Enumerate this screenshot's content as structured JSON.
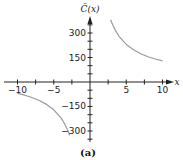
{
  "chart_data": {
    "type": "line",
    "title": "",
    "caption": "(a)",
    "xlabel": "x",
    "ylabel": "C̄(x)",
    "xlim": [
      -10,
      10
    ],
    "ylim": [
      -400,
      400
    ],
    "x_ticks": [
      -10,
      -7.5,
      -5,
      -2.5,
      2.5,
      5,
      7.5,
      10
    ],
    "x_tick_labels": [
      {
        "value": -10,
        "label": "−10"
      },
      {
        "value": -5,
        "label": "−5"
      },
      {
        "value": 5,
        "label": "5"
      },
      {
        "value": 10,
        "label": "10"
      }
    ],
    "y_ticks": [
      -350,
      -300,
      -250,
      -200,
      -150,
      -100,
      -50,
      50,
      100,
      150,
      200,
      250,
      300,
      350
    ],
    "y_tick_labels": [
      {
        "value": 300,
        "label": "300"
      },
      {
        "value": 150,
        "label": "150"
      },
      {
        "value": -150,
        "label": "−150"
      },
      {
        "value": -300,
        "label": "−300"
      }
    ],
    "grid": false,
    "legend": null,
    "series": [
      {
        "name": "left branch",
        "x": [
          -10,
          -9,
          -8,
          -7,
          -6,
          -5,
          -4,
          -3.5,
          -3,
          -2.8
        ],
        "y": [
          -70,
          -81,
          -95,
          -113,
          -137,
          -170,
          -220,
          -256,
          -303,
          -327
        ]
      },
      {
        "name": "right branch",
        "x": [
          2.85,
          3,
          3.5,
          4,
          5,
          6,
          7,
          8,
          9,
          10
        ],
        "y": [
          381,
          363,
          316,
          280,
          230,
          197,
          173,
          155,
          141,
          130
        ]
      }
    ],
    "line_color": "#9a9a9a",
    "axis_color": "#222222"
  }
}
